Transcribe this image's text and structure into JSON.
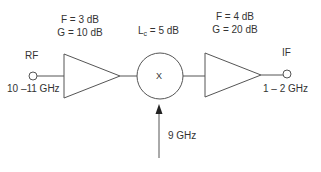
{
  "diagram": {
    "type": "receiver-front-end-block-diagram",
    "input_port": {
      "label": "RF",
      "frequency": "10 –11 GHz"
    },
    "amplifier_1": {
      "noise_figure": "F = 3 dB",
      "gain": "G = 10 dB"
    },
    "mixer": {
      "symbol": "X",
      "loss_label_prefix": "L",
      "loss_label_sub": "c",
      "loss_label_value": " = 5 dB"
    },
    "amplifier_2": {
      "noise_figure": "F = 4 dB",
      "gain": "G = 20 dB"
    },
    "output_port": {
      "label": "IF",
      "frequency": "1 – 2 GHz"
    },
    "local_oscillator": {
      "frequency": "9 GHz",
      "label": ""
    },
    "colors": {
      "line": "#555555",
      "text": "#333333"
    }
  }
}
